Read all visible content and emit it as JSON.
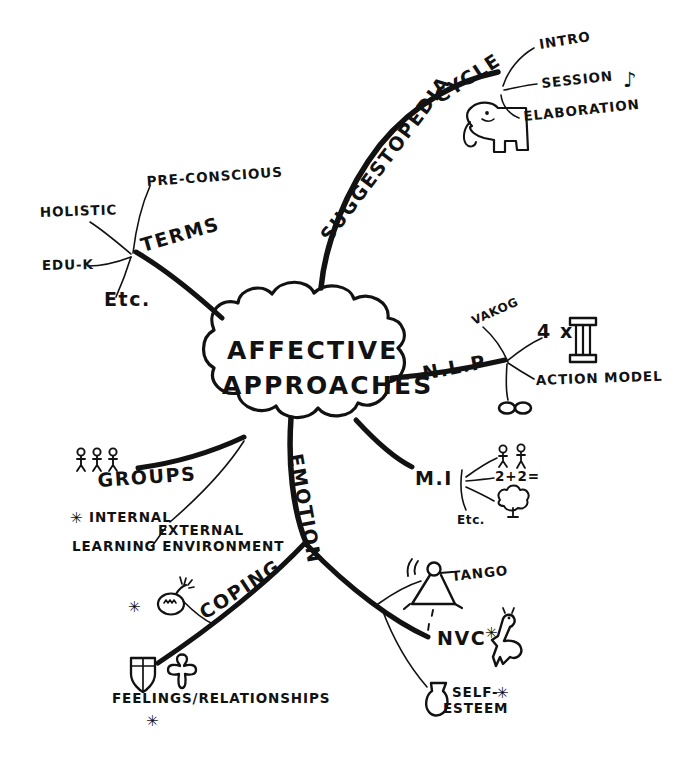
{
  "document": {
    "type": "hand-drawn-mind-map",
    "title": "Affective Approaches",
    "ink_color": "#121212",
    "background_color": "#ffffff",
    "width": 680,
    "height": 770
  },
  "center": {
    "name": "central-node",
    "line1": "AFFECTIVE",
    "line2": "APPROACHES",
    "shape": "cloud"
  },
  "branches": [
    {
      "id": "suggestopedia",
      "label": "SUGGESTOPEDIA",
      "direction": "top-right",
      "children": [
        {
          "id": "cycle",
          "label": "CYCLE",
          "children": [
            {
              "id": "intro",
              "label": "INTRO"
            },
            {
              "id": "session",
              "label": "SESSION",
              "icon": "music-note-icon",
              "icon_glyph": "♪"
            },
            {
              "id": "elaboration",
              "label": "ELABORATION"
            }
          ],
          "icon": "elephant-icon"
        }
      ]
    },
    {
      "id": "terms",
      "label": "TERMS",
      "direction": "top-left",
      "children": [
        {
          "id": "pre-conscious",
          "label": "PRE-CONSCIOUS"
        },
        {
          "id": "holistic",
          "label": "HOLISTIC"
        },
        {
          "id": "edu-k",
          "label": "EDU-K"
        },
        {
          "id": "etc-terms",
          "label": "Etc."
        }
      ]
    },
    {
      "id": "nlp",
      "label": "N.L.P",
      "direction": "right",
      "children": [
        {
          "id": "vakog",
          "label": "VAKOG"
        },
        {
          "id": "four-times",
          "label": "4 x",
          "icon": "column-icon"
        },
        {
          "id": "action-model",
          "label": "ACTION MODEL"
        },
        {
          "id": "eyes",
          "label": "OO",
          "icon": "eyes-icon"
        }
      ]
    },
    {
      "id": "mi",
      "label": "M.I",
      "direction": "right-lower",
      "children": [
        {
          "id": "mi-people",
          "label": "",
          "icon": "two-people-icon"
        },
        {
          "id": "mi-math",
          "label": "2+2="
        },
        {
          "id": "mi-nature",
          "label": "",
          "icon": "tree-icon"
        },
        {
          "id": "mi-etc",
          "label": "Etc."
        }
      ]
    },
    {
      "id": "groups",
      "label": "GROUPS",
      "direction": "left",
      "icon": "three-people-icon",
      "children": [
        {
          "id": "internal",
          "label": "INTERNAL",
          "marker": "*"
        },
        {
          "id": "external",
          "label": "EXTERNAL"
        },
        {
          "id": "learning-environment",
          "label": "LEARNING ENVIRONMENT"
        }
      ]
    },
    {
      "id": "emotion",
      "label": "EMOTION",
      "direction": "bottom",
      "children": [
        {
          "id": "coping",
          "label": "COPING",
          "icon": "bomb-icon",
          "marker": "*",
          "children": [
            {
              "id": "feelings-relationships",
              "label": "FEELINGS/RELATIONSHIPS",
              "marker": "*",
              "icons": [
                "shield-icon",
                "person-icon"
              ]
            }
          ]
        },
        {
          "id": "emotion-right",
          "label": "",
          "children": [
            {
              "id": "tango",
              "label": "TANGO",
              "icon": "dancer-icon"
            },
            {
              "id": "nvc",
              "label": "NVC",
              "marker": "*",
              "icon": "giraffe-icon"
            },
            {
              "id": "self-esteem",
              "label": "SELF-\nESTEEM",
              "line1": "SELF-",
              "line2": "ESTEEM",
              "marker": "*",
              "icon": "vase-icon"
            }
          ]
        }
      ]
    }
  ],
  "labels": {
    "center_line1": "AFFECTIVE",
    "center_line2": "APPROACHES",
    "suggestopedia": "SUGGESTOPEDIA",
    "cycle": "CYCLE",
    "intro": "INTRO",
    "session": "SESSION",
    "elaboration": "ELABORATION",
    "terms": "TERMS",
    "pre_conscious": "PRE-CONSCIOUS",
    "holistic": "HOLISTIC",
    "edu_k": "EDU-K",
    "etc_terms": "Etc.",
    "nlp": "N.L.P",
    "vakog": "VAKOG",
    "four_times": "4 x",
    "action_model": "ACTION MODEL",
    "mi": "M.I",
    "mi_math": "2+2=",
    "mi_etc": "Etc.",
    "groups": "GROUPS",
    "internal": "INTERNAL",
    "external": "EXTERNAL",
    "learning_environment": "LEARNING ENVIRONMENT",
    "emotion": "EMOTION",
    "coping": "COPING",
    "feelings_relationships": "FEELINGS/RELATIONSHIPS",
    "tango": "TANGO",
    "nvc": "NVC",
    "self_esteem_1": "SELF-",
    "self_esteem_2": "ESTEEM",
    "music_note": "♪",
    "asterisk": "✳",
    "star_small": "✳"
  }
}
